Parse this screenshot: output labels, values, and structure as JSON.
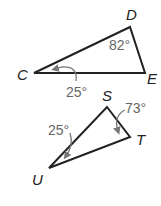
{
  "triangles": [
    {
      "name": "CDE",
      "vertices": {
        "C": "C",
        "D": "D",
        "E": "E"
      },
      "angles": {
        "D": "82°",
        "C": "25°"
      }
    },
    {
      "name": "STU",
      "vertices": {
        "S": "S",
        "T": "T",
        "U": "U"
      },
      "angles": {
        "S": "73°",
        "U": "25°"
      }
    }
  ],
  "colors": {
    "stroke": "#222222",
    "annotation": "#777777"
  }
}
